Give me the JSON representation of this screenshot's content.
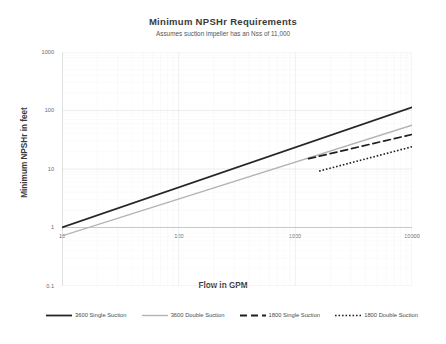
{
  "chart_data": {
    "type": "line",
    "title": "Minimum  NPSHr Requirements",
    "subtitle": "Assumes suction impeller has an Nss of 11,000",
    "xlabel": "Flow in GPM",
    "ylabel": "Minimum NPSHr in feet",
    "xscale": "log",
    "yscale": "log",
    "xlim": [
      10,
      10000
    ],
    "ylim": [
      0.1,
      1000
    ],
    "xticks": [
      "10",
      "100",
      "1000",
      "10000"
    ],
    "yticks": [
      "1000",
      "100",
      "10",
      "1",
      "0.1"
    ],
    "grid": true,
    "legend_position": "bottom",
    "series": [
      {
        "name": "3600 Single Suction",
        "style": "solid",
        "color": "#262626",
        "width": 1.7,
        "points": [
          [
            10,
            1.0
          ],
          [
            10000,
            113.0
          ]
        ]
      },
      {
        "name": "3600 Double Suction",
        "style": "solid",
        "color": "#b3b3b3",
        "width": 1.3,
        "points": [
          [
            10,
            0.72
          ],
          [
            10000,
            56.0
          ]
        ]
      },
      {
        "name": "1800 Single Suction",
        "style": "dashed",
        "color": "#1f1f1f",
        "width": 1.7,
        "points": [
          [
            1300,
            15.0
          ],
          [
            10000,
            39.0
          ]
        ]
      },
      {
        "name": "1800 Double Suction",
        "style": "dotted",
        "color": "#1f1f1f",
        "width": 1.6,
        "points": [
          [
            1600,
            9.2
          ],
          [
            10000,
            24.0
          ]
        ]
      }
    ]
  },
  "legend": {
    "items": [
      {
        "label": "3600 Single Suction"
      },
      {
        "label": "3600 Double Suction"
      },
      {
        "label": "1800 Single Suction"
      },
      {
        "label": "1800 Double Suction"
      }
    ]
  },
  "colors": {
    "axis": "#c8c8c8",
    "grid": "#e6e6e6",
    "text": "#404040",
    "series_dark": "#262626",
    "series_light": "#b3b3b3"
  }
}
